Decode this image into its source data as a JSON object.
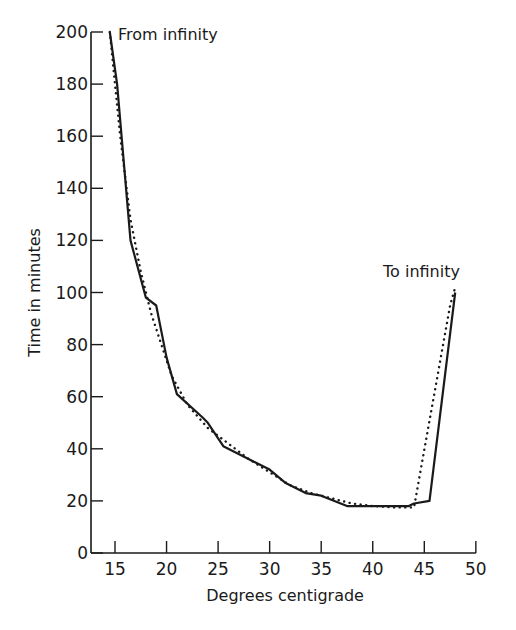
{
  "chart_data": {
    "type": "line",
    "title": "",
    "xlabel": "Degrees centigrade",
    "ylabel": "Time in minutes",
    "xlim": [
      12.5,
      50
    ],
    "ylim": [
      0,
      200
    ],
    "xticks": [
      15,
      20,
      25,
      30,
      35,
      40,
      45,
      50
    ],
    "yticks": [
      0,
      20,
      40,
      60,
      80,
      100,
      120,
      140,
      160,
      180,
      200
    ],
    "grid": false,
    "legend": null,
    "annotations": [
      {
        "text": "From infinity",
        "x": 15,
        "y": 200
      },
      {
        "text": "To infinity",
        "x": 48,
        "y": 100
      }
    ],
    "series": [
      {
        "name": "observed",
        "style": "solid",
        "x": [
          14.5,
          15.2,
          16.5,
          18.0,
          19.0,
          20.0,
          21.0,
          23.5,
          24.0,
          25.5,
          28.0,
          30.0,
          31.5,
          33.5,
          35.0,
          37.5,
          40.0,
          43.5,
          44.0,
          45.5,
          48.0
        ],
        "y": [
          200,
          180,
          120,
          98,
          95,
          75,
          61,
          52,
          50,
          41,
          36,
          32,
          27,
          23,
          22,
          18,
          18,
          18,
          19,
          20,
          100
        ]
      },
      {
        "name": "smoothed",
        "style": "dotted",
        "x": [
          14.5,
          15.5,
          16.5,
          17.5,
          18.5,
          19.5,
          20.5,
          22.0,
          24.0,
          26.0,
          28.0,
          30.0,
          32.0,
          34.0,
          36.0,
          38.0,
          40.0,
          42.0,
          44.0,
          47.5,
          48.0
        ],
        "y": [
          200,
          160,
          128,
          108,
          92,
          80,
          68,
          57,
          48,
          42,
          36,
          31,
          26,
          23,
          21,
          19,
          18,
          17.5,
          17.5,
          95,
          102
        ]
      }
    ]
  }
}
